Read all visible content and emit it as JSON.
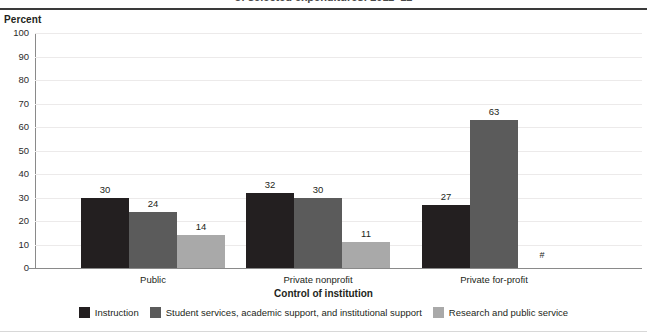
{
  "figure": {
    "clipped_title": "of selected expenditures: 2011–12",
    "y_axis_title": "Percent",
    "x_axis_title": "Control of institution",
    "footnote_symbol": "#"
  },
  "chart_data": {
    "type": "bar",
    "title": "of selected expenditures: 2011–12",
    "xlabel": "Control of institution",
    "ylabel": "Percent",
    "ylim": [
      0,
      100
    ],
    "ytick_labels": [
      "0",
      "10",
      "20",
      "30",
      "40",
      "50",
      "60",
      "70",
      "80",
      "90",
      "100"
    ],
    "ytick_values": [
      0,
      10,
      20,
      30,
      40,
      50,
      60,
      70,
      80,
      90,
      100
    ],
    "grid": true,
    "legend_position": "bottom",
    "categories": [
      "Public",
      "Private nonprofit",
      "Private for-profit"
    ],
    "series": [
      {
        "name": "Instruction",
        "color": "#231f20",
        "values": [
          30,
          32,
          27
        ],
        "labels": [
          "30",
          "32",
          "27"
        ]
      },
      {
        "name": "Student services, academic support, and institutional support",
        "color": "#5b5b5b",
        "values": [
          24,
          30,
          63
        ],
        "labels": [
          "24",
          "30",
          "63"
        ]
      },
      {
        "name": "Research and public service",
        "color": "#a9a9a9",
        "values": [
          14,
          11,
          null
        ],
        "labels": [
          "14",
          "11",
          "#"
        ]
      }
    ]
  }
}
